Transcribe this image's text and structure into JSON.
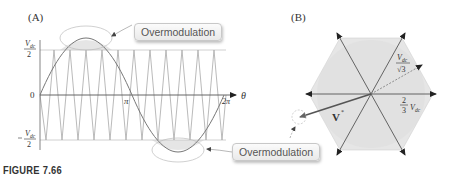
{
  "figure": {
    "caption": "FIGURE 7.66",
    "panels": [
      {
        "label": "(A)",
        "y_ticks": [
          "Vdc/2",
          "0",
          "-Vdc/2"
        ],
        "x_ticks": [
          "π",
          "2π"
        ],
        "x_axis_label": "θ",
        "annotations": [
          "Overmodulation",
          "Overmodulation"
        ]
      },
      {
        "label": "(B)",
        "vector_label": "V*",
        "radius_labels": [
          "Vdc/√3",
          "2/3 Vdc"
        ]
      }
    ]
  },
  "labels": {
    "panel_a": "(A)",
    "panel_b": "(B)",
    "overmod_top": "Overmodulation",
    "overmod_bottom": "Overmodulation",
    "caption": "FIGURE 7.66"
  },
  "colors": {
    "carrier": "#a8a8a8",
    "reference": "#7a7a7a",
    "hexagon_fill": "#e6e6e6",
    "vector": "#555555",
    "arrows": "#222222"
  }
}
